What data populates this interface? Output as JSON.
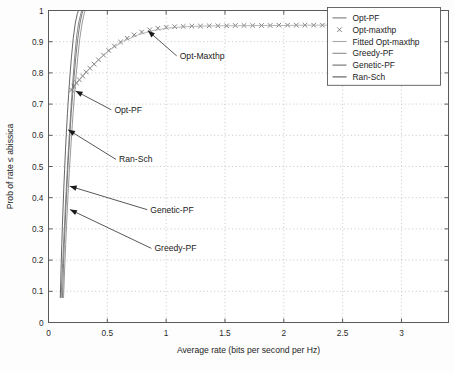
{
  "chart_data": {
    "type": "line",
    "title": "",
    "xlabel": "Average rate (bits per second per Hz)",
    "ylabel": "Prob of rate ≤ abissica",
    "xlim": [
      0,
      3.4
    ],
    "ylim": [
      0,
      1
    ],
    "xticks": [
      "0",
      "0.5",
      "1",
      "1.5",
      "2",
      "2.5",
      "3"
    ],
    "xtick_values": [
      0,
      0.5,
      1,
      1.5,
      2,
      2.5,
      3
    ],
    "yticks": [
      "0",
      "0.1",
      "0.2",
      "0.3",
      "0.4",
      "0.5",
      "0.6",
      "0.7",
      "0.8",
      "0.9",
      "1"
    ],
    "ytick_values": [
      0,
      0.1,
      0.2,
      0.3,
      0.4,
      0.5,
      0.6,
      0.7,
      0.8,
      0.9,
      1
    ],
    "grid": true,
    "legend_position": "top-right",
    "series": [
      {
        "name": "Opt-PF",
        "style": "line",
        "color": "#7a7a7a",
        "points": [
          [
            0.108,
            0.08
          ],
          [
            0.112,
            0.12
          ],
          [
            0.118,
            0.17
          ],
          [
            0.124,
            0.22
          ],
          [
            0.13,
            0.27
          ],
          [
            0.137,
            0.32
          ],
          [
            0.143,
            0.37
          ],
          [
            0.15,
            0.42
          ],
          [
            0.157,
            0.47
          ],
          [
            0.164,
            0.52
          ],
          [
            0.172,
            0.57
          ],
          [
            0.18,
            0.62
          ],
          [
            0.188,
            0.67
          ],
          [
            0.197,
            0.72
          ],
          [
            0.206,
            0.77
          ],
          [
            0.216,
            0.82
          ],
          [
            0.227,
            0.87
          ],
          [
            0.24,
            0.92
          ],
          [
            0.256,
            0.96
          ],
          [
            0.272,
            0.985
          ],
          [
            0.282,
            1.0
          ]
        ]
      },
      {
        "name": "Opt-maxthp",
        "style": "marker",
        "color": "#6b6b6b",
        "points": [
          [
            0.195,
            0.745
          ],
          [
            0.215,
            0.757
          ],
          [
            0.238,
            0.768
          ],
          [
            0.262,
            0.778
          ],
          [
            0.29,
            0.79
          ],
          [
            0.32,
            0.803
          ],
          [
            0.352,
            0.815
          ],
          [
            0.388,
            0.828
          ],
          [
            0.425,
            0.842
          ],
          [
            0.468,
            0.857
          ],
          [
            0.512,
            0.872
          ],
          [
            0.56,
            0.886
          ],
          [
            0.612,
            0.899
          ],
          [
            0.668,
            0.911
          ],
          [
            0.728,
            0.922
          ],
          [
            0.792,
            0.931
          ],
          [
            0.86,
            0.938
          ],
          [
            0.93,
            0.943
          ],
          [
            1.0,
            0.946
          ],
          [
            1.072,
            0.948
          ],
          [
            1.145,
            0.949
          ],
          [
            1.218,
            0.95
          ],
          [
            1.292,
            0.95
          ],
          [
            1.366,
            0.951
          ],
          [
            1.44,
            0.951
          ],
          [
            1.514,
            0.951
          ],
          [
            1.588,
            0.952
          ],
          [
            1.662,
            0.952
          ],
          [
            1.736,
            0.952
          ],
          [
            1.81,
            0.952
          ],
          [
            1.884,
            0.952
          ],
          [
            1.958,
            0.953
          ],
          [
            2.032,
            0.953
          ],
          [
            2.106,
            0.953
          ],
          [
            2.18,
            0.953
          ],
          [
            2.254,
            0.953
          ],
          [
            2.328,
            0.953
          ],
          [
            2.402,
            0.953
          ],
          [
            2.476,
            0.953
          ]
        ]
      },
      {
        "name": "Fitted Opt-maxthp",
        "style": "line",
        "color": "#a9a9a9",
        "points": [
          [
            0.19,
            0.742
          ],
          [
            0.26,
            0.776
          ],
          [
            0.34,
            0.81
          ],
          [
            0.43,
            0.844
          ],
          [
            0.53,
            0.876
          ],
          [
            0.64,
            0.902
          ],
          [
            0.76,
            0.922
          ],
          [
            0.89,
            0.936
          ],
          [
            1.02,
            0.944
          ],
          [
            1.16,
            0.948
          ],
          [
            1.3,
            0.95
          ],
          [
            1.45,
            0.951
          ],
          [
            1.6,
            0.951
          ],
          [
            1.8,
            0.952
          ],
          [
            2.0,
            0.952
          ],
          [
            2.2,
            0.953
          ],
          [
            2.48,
            0.953
          ]
        ]
      },
      {
        "name": "Greedy-PF",
        "style": "line",
        "color": "#8c8c8c",
        "points": [
          [
            0.128,
            0.08
          ],
          [
            0.133,
            0.13
          ],
          [
            0.139,
            0.19
          ],
          [
            0.146,
            0.25
          ],
          [
            0.153,
            0.31
          ],
          [
            0.161,
            0.37
          ],
          [
            0.169,
            0.43
          ],
          [
            0.178,
            0.49
          ],
          [
            0.188,
            0.55
          ],
          [
            0.198,
            0.61
          ],
          [
            0.209,
            0.67
          ],
          [
            0.221,
            0.73
          ],
          [
            0.234,
            0.79
          ],
          [
            0.249,
            0.85
          ],
          [
            0.266,
            0.91
          ],
          [
            0.286,
            0.96
          ],
          [
            0.303,
            0.99
          ],
          [
            0.312,
            1.0
          ]
        ]
      },
      {
        "name": "Genetic-PF",
        "style": "line",
        "color": "#6e6e6e",
        "points": [
          [
            0.118,
            0.08
          ],
          [
            0.123,
            0.13
          ],
          [
            0.128,
            0.19
          ],
          [
            0.134,
            0.25
          ],
          [
            0.141,
            0.31
          ],
          [
            0.148,
            0.37
          ],
          [
            0.156,
            0.43
          ],
          [
            0.164,
            0.49
          ],
          [
            0.173,
            0.55
          ],
          [
            0.183,
            0.61
          ],
          [
            0.193,
            0.67
          ],
          [
            0.205,
            0.73
          ],
          [
            0.218,
            0.79
          ],
          [
            0.232,
            0.85
          ],
          [
            0.249,
            0.91
          ],
          [
            0.268,
            0.96
          ],
          [
            0.285,
            0.99
          ],
          [
            0.294,
            1.0
          ]
        ]
      },
      {
        "name": "Ran-Sch",
        "style": "line",
        "color": "#555555",
        "points": [
          [
            0.1,
            0.08
          ],
          [
            0.104,
            0.13
          ],
          [
            0.108,
            0.19
          ],
          [
            0.113,
            0.25
          ],
          [
            0.118,
            0.31
          ],
          [
            0.124,
            0.37
          ],
          [
            0.13,
            0.43
          ],
          [
            0.137,
            0.49
          ],
          [
            0.144,
            0.55
          ],
          [
            0.152,
            0.61
          ],
          [
            0.161,
            0.67
          ],
          [
            0.171,
            0.73
          ],
          [
            0.182,
            0.79
          ],
          [
            0.195,
            0.85
          ],
          [
            0.21,
            0.91
          ],
          [
            0.228,
            0.96
          ],
          [
            0.245,
            0.99
          ],
          [
            0.254,
            1.0
          ]
        ]
      }
    ],
    "annotations": [
      {
        "label": "Opt-Maxthp",
        "text_x": 1.115,
        "text_y": 0.845,
        "tip_x": 0.845,
        "tip_y": 0.935
      },
      {
        "label": "Opt-PF",
        "text_x": 0.56,
        "text_y": 0.672,
        "tip_x": 0.23,
        "tip_y": 0.742
      },
      {
        "label": "Ran-Sch",
        "text_x": 0.6,
        "text_y": 0.513,
        "tip_x": 0.166,
        "tip_y": 0.618
      },
      {
        "label": "Genetic-PF",
        "text_x": 0.865,
        "text_y": 0.352,
        "tip_x": 0.18,
        "tip_y": 0.437
      },
      {
        "label": "Greedy-PF",
        "text_x": 0.9,
        "text_y": 0.228,
        "tip_x": 0.182,
        "tip_y": 0.362
      }
    ],
    "legend_entries": [
      {
        "label": "Opt-PF",
        "marker": "line",
        "color": "#7a7a7a"
      },
      {
        "label": "Opt-maxthp",
        "marker": "cross",
        "color": "#6b6b6b"
      },
      {
        "label": "Fitted Opt-maxthp",
        "marker": "line",
        "color": "#a9a9a9"
      },
      {
        "label": "Greedy-PF",
        "marker": "line",
        "color": "#8c8c8c"
      },
      {
        "label": "Genetic-PF",
        "marker": "line",
        "color": "#6e6e6e"
      },
      {
        "label": "Ran-Sch",
        "marker": "line",
        "color": "#555555"
      }
    ]
  }
}
